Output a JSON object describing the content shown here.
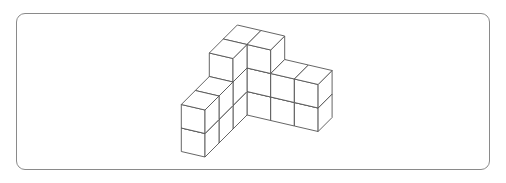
{
  "figure": {
    "cube_count": 17,
    "colors": {
      "face": "#ffffff",
      "edge": "#555555",
      "frame": "#8a8a8a"
    },
    "projection": {
      "origin": [
        247,
        115
      ],
      "x_axis": [
        23.7,
        5.5
      ],
      "depth_axis": [
        14,
        -14
      ],
      "up_axis": [
        0,
        -23.5
      ]
    },
    "columns": [
      {
        "i": -1,
        "j": -3,
        "height": 2
      },
      {
        "i": -1,
        "j": -2,
        "height": 2
      },
      {
        "i": -1,
        "j": -1,
        "height": 3
      },
      {
        "i": -1,
        "j": 0,
        "height": 3
      },
      {
        "i": 0,
        "j": 0,
        "height": 3
      },
      {
        "i": 1,
        "j": 0,
        "height": 2
      },
      {
        "i": 2,
        "j": 0,
        "height": 2
      }
    ]
  }
}
